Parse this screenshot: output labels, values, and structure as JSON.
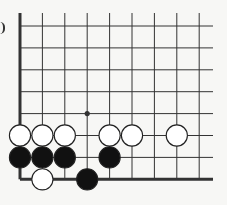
{
  "diagram": {
    "type": "go-board-fragment",
    "corner": "bottom-left",
    "columns": 9,
    "rows": 8,
    "star_point": {
      "col": 3,
      "row": 4
    },
    "stones": [
      {
        "color": "white",
        "col": 0,
        "row": 5
      },
      {
        "color": "white",
        "col": 1,
        "row": 5
      },
      {
        "color": "white",
        "col": 2,
        "row": 5
      },
      {
        "color": "white",
        "col": 4,
        "row": 5
      },
      {
        "color": "white",
        "col": 5,
        "row": 5
      },
      {
        "color": "white",
        "col": 7,
        "row": 5
      },
      {
        "color": "black",
        "col": 0,
        "row": 6
      },
      {
        "color": "black",
        "col": 1,
        "row": 6
      },
      {
        "color": "black",
        "col": 2,
        "row": 6
      },
      {
        "color": "black",
        "col": 4,
        "row": 6
      },
      {
        "color": "white",
        "col": 1,
        "row": 7
      },
      {
        "color": "black",
        "col": 3,
        "row": 7
      }
    ],
    "colors": {
      "line": "#333333",
      "black_stone": "#111111",
      "white_stone": "#ffffff",
      "background": "#f7f7f5"
    }
  }
}
